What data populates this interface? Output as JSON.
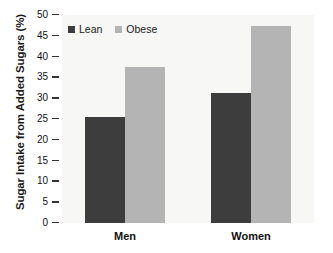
{
  "chart_data": {
    "type": "bar",
    "title": "",
    "xlabel": "",
    "ylabel": "Sugar Intake from Added Sugars (%)",
    "categories": [
      "Men",
      "Women"
    ],
    "series": [
      {
        "name": "Lean",
        "values": [
          25.5,
          31.3
        ],
        "color": "#3d3d3d"
      },
      {
        "name": "Obese",
        "values": [
          37.5,
          47.3
        ],
        "color": "#b4b4b4"
      }
    ],
    "ylim": [
      0,
      50
    ],
    "yticks": [
      0,
      5,
      10,
      15,
      20,
      25,
      30,
      35,
      40,
      45,
      50
    ],
    "ytick_labels": [
      "0",
      "5",
      "10",
      "15",
      "20",
      "25",
      "30",
      "35",
      "40",
      "45",
      "50"
    ],
    "grid": false,
    "legend_position": "top-left",
    "plot_background": "#f7f7f5"
  }
}
